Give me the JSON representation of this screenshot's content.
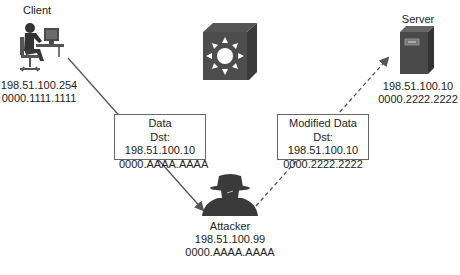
{
  "diagram": {
    "type": "network-mitm-attack",
    "nodes": {
      "client": {
        "title": "Client",
        "ip": "198.51.100.254",
        "mac": "0000.1111.1111",
        "icon": "workstation-user-icon"
      },
      "server": {
        "title": "Server",
        "ip": "198.51.100.10",
        "mac": "0000.2222.2222",
        "icon": "server-tower-icon"
      },
      "switch": {
        "icon": "layer3-switch-icon"
      },
      "attacker": {
        "title": "Attacker",
        "ip": "198.51.100.99",
        "mac": "0000.AAAA.AAAA",
        "icon": "spy-hat-icon"
      }
    },
    "frames": {
      "original": {
        "title": "Data",
        "dst": "Dst: 198.51.100.10",
        "mac": "0000.AAAA.AAAA",
        "from": "client",
        "to": "attacker",
        "style": "solid"
      },
      "modified": {
        "title": "Modified Data",
        "dst": "Dst: 198.51.100.10",
        "mac": "0000.2222.2222",
        "from": "attacker",
        "to": "server",
        "style": "dashed"
      }
    },
    "colors": {
      "icon_dark": "#3a3a3a",
      "line": "#555555",
      "box_border": "#666666"
    }
  }
}
